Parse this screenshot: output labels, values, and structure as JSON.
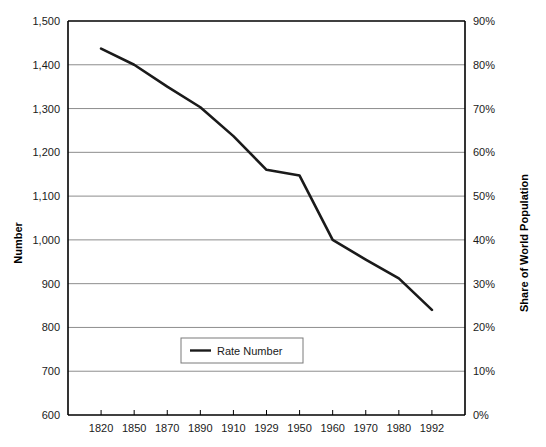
{
  "chart_data": {
    "type": "line",
    "title": "",
    "xlabel": "",
    "ylabel": "Number",
    "y2label": "Share of World Population",
    "categories": [
      "1820",
      "1850",
      "1870",
      "1890",
      "1910",
      "1929",
      "1950",
      "1960",
      "1970",
      "1980",
      "1992"
    ],
    "series": [
      {
        "name": "Rate Number",
        "values": [
          1437,
          1400,
          1350,
          1303,
          1237,
          1160,
          1147,
          1000,
          955,
          912,
          840
        ],
        "color": "#1a1a1a"
      }
    ],
    "ylim": [
      600,
      1500
    ],
    "yticks": [
      "600",
      "700",
      "800",
      "900",
      "1,000",
      "1,100",
      "1,200",
      "1,300",
      "1,400",
      "1,500"
    ],
    "y2lim": [
      0,
      90
    ],
    "y2ticks": [
      "0%",
      "10%",
      "20%",
      "30%",
      "40%",
      "50%",
      "60%",
      "70%",
      "80%",
      "90%"
    ],
    "grid": true,
    "legend_position": "inside-bottom-center",
    "legend_entries": [
      "Rate Number"
    ],
    "background_color": "#ffffff",
    "axis_color": "#000000",
    "grid_color": "#808080"
  },
  "legend": {
    "entry_label": "Rate Number"
  },
  "axes": {
    "left_title": "Number",
    "right_title": "Share of World Population"
  }
}
